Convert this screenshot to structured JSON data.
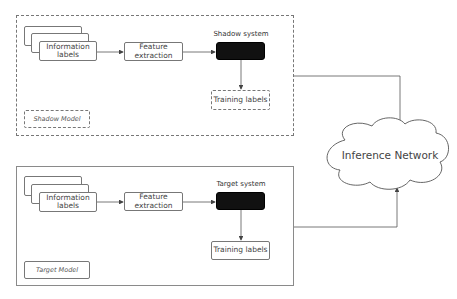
{
  "shadow_model": {
    "label": "Shadow Model",
    "input": {
      "line1": "Information",
      "line2": "labels"
    },
    "feature": {
      "line1": "Feature",
      "line2": "extraction"
    },
    "system_label": "Shadow system",
    "output": "Training labels"
  },
  "target_model": {
    "label": "Target Model",
    "input": {
      "line1": "Information",
      "line2": "labels"
    },
    "feature": {
      "line1": "Feature",
      "line2": "extraction"
    },
    "system_label": "Target system",
    "output": "Training labels"
  },
  "inference": {
    "label": "Inference Network"
  },
  "colors": {
    "line": "#555555",
    "system_fill": "#111111",
    "border": "#777777"
  }
}
